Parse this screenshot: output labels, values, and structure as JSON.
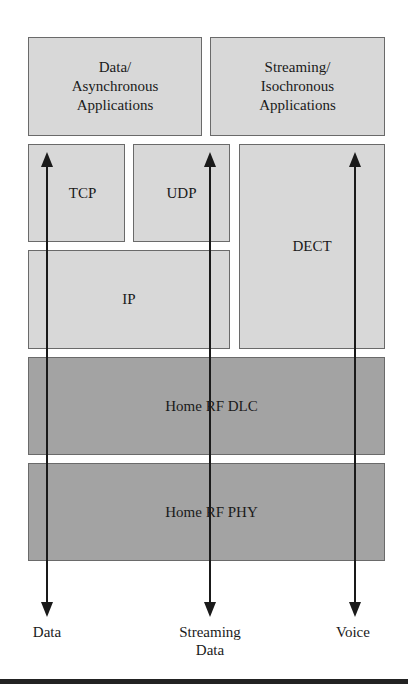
{
  "diagram": {
    "boxes": {
      "data_apps": "Data/\nAsynchronous\nApplications",
      "data_apps_lines": [
        "Data/",
        "Asynchronous",
        "Applications"
      ],
      "stream_apps_lines": [
        "Streaming/",
        "Isochronous",
        "Applications"
      ],
      "tcp": "TCP",
      "udp": "UDP",
      "dect": "DECT",
      "ip": "IP",
      "dlc": "Home RF DLC",
      "phy": "Home RF PHY"
    },
    "flows": [
      {
        "label_lines": [
          "Data"
        ]
      },
      {
        "label_lines": [
          "Streaming",
          "Data"
        ]
      },
      {
        "label_lines": [
          "Voice"
        ]
      }
    ],
    "colors": {
      "upper_layer_fill": "#d8d8d8",
      "lower_layer_fill": "#a3a3a3",
      "border": "#6a6a6a",
      "arrow": "#1a1a1a"
    }
  }
}
